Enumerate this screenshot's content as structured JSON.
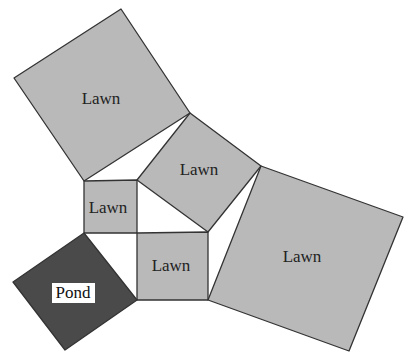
{
  "diagram": {
    "title": "",
    "colors": {
      "background": "#ffffff",
      "lawn_fill": "#b9b9b9",
      "pond_fill": "#4a4a4a",
      "stroke": "#333333",
      "pond_label_bg": "#ffffff"
    },
    "regions": [
      {
        "id": "lawn-top-left",
        "type": "lawn",
        "label": "Lawn",
        "points": "14,78 121,9 190,113 84,181",
        "label_pos": [
          101,
          104
        ]
      },
      {
        "id": "lawn-center-upper",
        "type": "lawn",
        "label": "Lawn",
        "points": "137,180 190,113 261,166 208,232",
        "label_pos": [
          199,
          175
        ]
      },
      {
        "id": "lawn-small-left",
        "type": "lawn",
        "label": "Lawn",
        "points": "84,181 137,180 137,233 84,233",
        "label_pos": [
          108,
          213
        ]
      },
      {
        "id": "lawn-small-bottom",
        "type": "lawn",
        "label": "Lawn",
        "points": "137,233 208,232 208,300 137,300",
        "label_pos": [
          171,
          271
        ]
      },
      {
        "id": "lawn-right-large",
        "type": "lawn",
        "label": "Lawn",
        "points": "208,300 261,166 403,217 349,351",
        "label_pos": [
          302,
          262
        ]
      },
      {
        "id": "pond",
        "type": "pond",
        "label": "Pond",
        "points": "84,233 137,300 65,350 13,282",
        "label_pos": [
          73,
          298
        ]
      }
    ],
    "gaps": [
      {
        "id": "gap-top",
        "points": "84,181 190,113 137,180"
      },
      {
        "id": "gap-center",
        "points": "137,180 208,232 137,233"
      },
      {
        "id": "gap-right",
        "points": "208,232 261,166 208,300"
      },
      {
        "id": "gap-left",
        "points": "84,233 137,233 137,300"
      }
    ]
  }
}
